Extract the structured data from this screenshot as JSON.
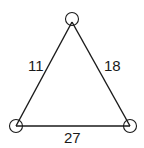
{
  "diagram": {
    "type": "weighted-triangle-graph",
    "nodes": [
      {
        "id": "top",
        "x": 72,
        "y": 19,
        "r": 6.5
      },
      {
        "id": "bottom-left",
        "x": 16,
        "y": 126,
        "r": 6.5
      },
      {
        "id": "bottom-right",
        "x": 130,
        "y": 126,
        "r": 6.5
      }
    ],
    "edges": [
      {
        "from": "top",
        "to": "bottom-left",
        "weight": "11",
        "label_x": 28,
        "label_y": 71
      },
      {
        "from": "top",
        "to": "bottom-right",
        "weight": "18",
        "label_x": 104,
        "label_y": 71
      },
      {
        "from": "bottom-left",
        "to": "bottom-right",
        "weight": "27",
        "label_x": 64,
        "label_y": 143
      }
    ],
    "colors": {
      "stroke": "#1a1a1a",
      "background": "#ffffff"
    }
  }
}
